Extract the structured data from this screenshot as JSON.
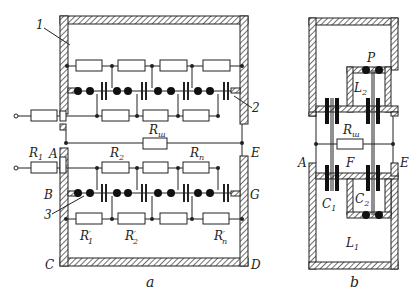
{
  "figure_a": {
    "caption": "a",
    "callouts": [
      "1",
      "2",
      "3"
    ],
    "nodes": {
      "A": "A",
      "B": "B",
      "C": "C",
      "D": "D",
      "E": "E",
      "G": "G"
    },
    "resistors_top_row_count": 4,
    "resistors": {
      "R1": {
        "base": "R",
        "sub": "1"
      },
      "Rsh": {
        "base": "R",
        "sub": "ш"
      },
      "R2": {
        "base": "R",
        "sub": "2"
      },
      "Rn": {
        "base": "R",
        "sub": "n"
      },
      "R1p": {
        "base": "R",
        "sub": "1",
        "prime": "′"
      },
      "R2p": {
        "base": "R",
        "sub": "2",
        "prime": "′"
      },
      "Rnp": {
        "base": "R",
        "sub": "n",
        "prime": "′"
      }
    }
  },
  "figure_b": {
    "caption": "b",
    "nodes": {
      "A": "A",
      "E": "E",
      "F": "F",
      "P": "P"
    },
    "components": {
      "Rsh": {
        "base": "R",
        "sub": "ш"
      },
      "C1": {
        "base": "C",
        "sub": "1"
      },
      "C2": {
        "base": "C",
        "sub": "2"
      },
      "L1": {
        "base": "L",
        "sub": "1"
      },
      "L2": {
        "base": "L",
        "sub": "2"
      }
    }
  }
}
